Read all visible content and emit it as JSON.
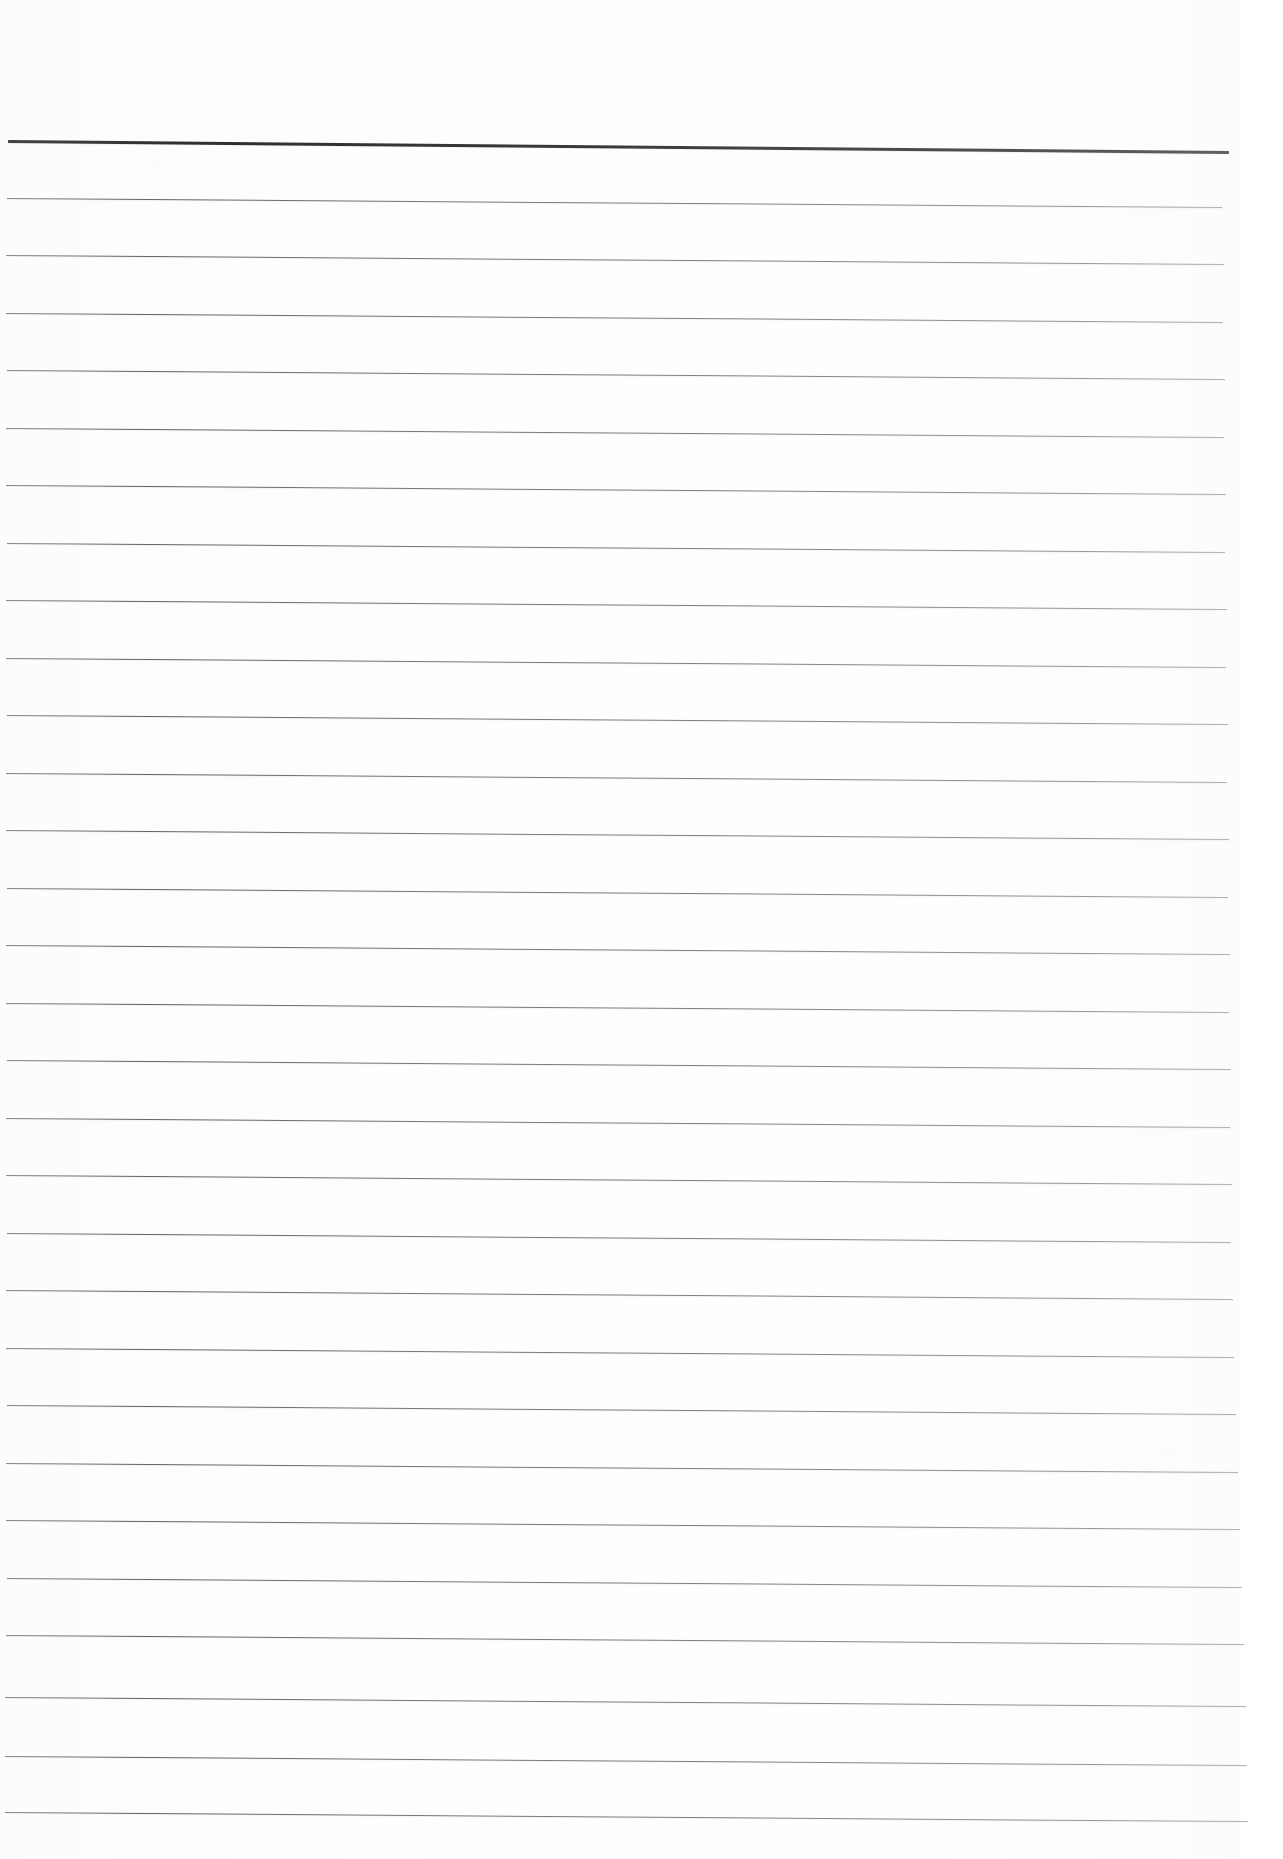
{
  "document": {
    "kind": "scanned-blank-lined-notebook-page",
    "description": "Blank ruled notebook page, scanned",
    "width_px": 1283,
    "height_px": 1859,
    "page_background_color": "#fdfdfd",
    "outer_background_color": "#ffffff",
    "text_content": "",
    "handwriting_present": "none",
    "printed_text_present": "none"
  },
  "paper": {
    "sheet_left_px": 0,
    "sheet_top_px": 0,
    "sheet_width_px": 1240,
    "sheet_height_px": 1859,
    "right_margin_width_px": 43,
    "right_margin_color": "#ffffff",
    "top_blank_margin_px": 140,
    "tone": "off-white",
    "grain": "light scanner mottling"
  },
  "ruling": {
    "header_rule": {
      "label": "header-rule",
      "y_left_px": 141,
      "y_right_px": 152,
      "x_start_px": 8,
      "x_end_px": 1229,
      "thickness_px": 2.6,
      "color": "#2e2e32",
      "tilt_deg": 0.52
    },
    "body_rule_count": 29,
    "body_rule_spacing_px": 57.4,
    "body_rule_first_y_px": 199,
    "body_rule_last_y_px": 1813,
    "body_rule_thickness_px": 1.15,
    "body_rule_color": "#60606a",
    "body_rule_tilt_deg": 0.42,
    "body_rules": [
      {
        "index": 1,
        "y_px": 199,
        "x_start_px": 7,
        "x_end_px": 1222
      },
      {
        "index": 2,
        "y_px": 256,
        "x_start_px": 6,
        "x_end_px": 1224
      },
      {
        "index": 3,
        "y_px": 314,
        "x_start_px": 6,
        "x_end_px": 1223
      },
      {
        "index": 4,
        "y_px": 371,
        "x_start_px": 7,
        "x_end_px": 1225
      },
      {
        "index": 5,
        "y_px": 429,
        "x_start_px": 6,
        "x_end_px": 1224
      },
      {
        "index": 6,
        "y_px": 486,
        "x_start_px": 6,
        "x_end_px": 1226
      },
      {
        "index": 7,
        "y_px": 544,
        "x_start_px": 7,
        "x_end_px": 1225
      },
      {
        "index": 8,
        "y_px": 601,
        "x_start_px": 6,
        "x_end_px": 1227
      },
      {
        "index": 9,
        "y_px": 659,
        "x_start_px": 6,
        "x_end_px": 1226
      },
      {
        "index": 10,
        "y_px": 716,
        "x_start_px": 7,
        "x_end_px": 1228
      },
      {
        "index": 11,
        "y_px": 774,
        "x_start_px": 6,
        "x_end_px": 1227
      },
      {
        "index": 12,
        "y_px": 831,
        "x_start_px": 6,
        "x_end_px": 1229
      },
      {
        "index": 13,
        "y_px": 889,
        "x_start_px": 7,
        "x_end_px": 1228
      },
      {
        "index": 14,
        "y_px": 946,
        "x_start_px": 6,
        "x_end_px": 1230
      },
      {
        "index": 15,
        "y_px": 1004,
        "x_start_px": 6,
        "x_end_px": 1229
      },
      {
        "index": 16,
        "y_px": 1061,
        "x_start_px": 7,
        "x_end_px": 1231
      },
      {
        "index": 17,
        "y_px": 1119,
        "x_start_px": 6,
        "x_end_px": 1230
      },
      {
        "index": 18,
        "y_px": 1176,
        "x_start_px": 6,
        "x_end_px": 1232
      },
      {
        "index": 19,
        "y_px": 1234,
        "x_start_px": 7,
        "x_end_px": 1231
      },
      {
        "index": 20,
        "y_px": 1291,
        "x_start_px": 6,
        "x_end_px": 1233
      },
      {
        "index": 21,
        "y_px": 1349,
        "x_start_px": 6,
        "x_end_px": 1234
      },
      {
        "index": 22,
        "y_px": 1406,
        "x_start_px": 7,
        "x_end_px": 1236
      },
      {
        "index": 23,
        "y_px": 1464,
        "x_start_px": 6,
        "x_end_px": 1238
      },
      {
        "index": 24,
        "y_px": 1521,
        "x_start_px": 6,
        "x_end_px": 1240
      },
      {
        "index": 25,
        "y_px": 1579,
        "x_start_px": 7,
        "x_end_px": 1242
      },
      {
        "index": 26,
        "y_px": 1636,
        "x_start_px": 6,
        "x_end_px": 1244
      },
      {
        "index": 27,
        "y_px": 1698,
        "x_start_px": 5,
        "x_end_px": 1246
      },
      {
        "index": 28,
        "y_px": 1757,
        "x_start_px": 5,
        "x_end_px": 1247
      },
      {
        "index": 29,
        "y_px": 1813,
        "x_start_px": 5,
        "x_end_px": 1248
      }
    ]
  },
  "accessibility": {
    "caption": "A scanned blank sheet of ruled notebook paper with one thick horizontal rule near the top and twenty-nine evenly spaced thin horizontal rules below it. No text or handwriting is present."
  }
}
